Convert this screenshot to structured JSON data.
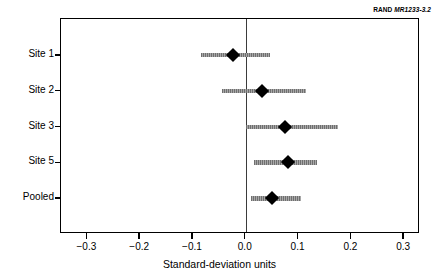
{
  "source_tag": {
    "org": "RAND",
    "ref": "MR1233-3.2"
  },
  "chart_data": {
    "type": "scatter",
    "subtype": "forest-plot",
    "title": "",
    "xlabel": "Standard-deviation units",
    "ylabel": "",
    "xlim": [
      -0.35,
      0.33
    ],
    "ylim": [
      0,
      5
    ],
    "grid": false,
    "legend": null,
    "reference_line": {
      "x": 0.0,
      "label": "zero-effect line",
      "color": "#3b3b3b"
    },
    "xticks": [
      -0.3,
      -0.2,
      -0.1,
      0.0,
      0.1,
      0.2,
      0.3
    ],
    "xticklabels": [
      "−0.3",
      "−0.2",
      "−0.1",
      "0.0",
      "0.1",
      "0.2",
      "0.3"
    ],
    "categories": [
      "Site 1",
      "Site 2",
      "Site 3",
      "Site 5",
      "Pooled"
    ],
    "point_color": "#000000",
    "interval_color": "#8c8c8c",
    "series": [
      {
        "name": "Effect estimate with confidence interval",
        "points": [
          {
            "category": "Site 1",
            "estimate": -0.025,
            "ci_low": -0.085,
            "ci_high": 0.045
          },
          {
            "category": "Site 2",
            "estimate": 0.03,
            "ci_low": -0.045,
            "ci_high": 0.115
          },
          {
            "category": "Site 3",
            "estimate": 0.075,
            "ci_low": 0.0,
            "ci_high": 0.175
          },
          {
            "category": "Site 5",
            "estimate": 0.08,
            "ci_low": 0.015,
            "ci_high": 0.135
          },
          {
            "category": "Pooled",
            "estimate": 0.05,
            "ci_low": 0.01,
            "ci_high": 0.105
          }
        ]
      }
    ]
  }
}
